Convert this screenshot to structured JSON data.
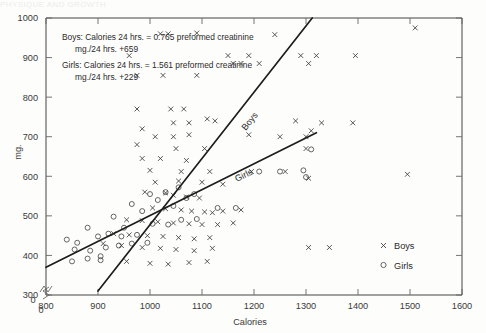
{
  "page_artifact": "PHYSIQUE AND GROWTH",
  "figure": {
    "y_axis_title": "mg.",
    "x_axis_title": "Calories",
    "origin_label": "0",
    "y_ticks": [
      300,
      400,
      500,
      600,
      700,
      800,
      900,
      1000
    ],
    "x_ticks": [
      800,
      900,
      1000,
      1100,
      1200,
      1300,
      1400,
      1500,
      1600
    ],
    "annotation": {
      "boys_line1": "Boys: Calories 24 hrs.  =  0.765 preformed creatinine",
      "boys_line2": "mg./24 hrs.  +659",
      "girls_line1": "Girls: Calories 24 hrs.  =  1.561 preformed creatinine",
      "girls_line2": "mg./24 hrs.  +229"
    },
    "curve_labels": {
      "boys": "Boys",
      "girls": "Girls"
    },
    "legend": [
      {
        "marker": "x-marker",
        "label": "Boys"
      },
      {
        "marker": "circle-marker",
        "label": "Girls"
      }
    ]
  },
  "chart_data": {
    "type": "scatter",
    "title": "",
    "xlabel": "Calories",
    "ylabel": "mg.",
    "xlim": [
      800,
      1600
    ],
    "ylim": [
      300,
      1000
    ],
    "xticks": [
      800,
      900,
      1000,
      1100,
      1200,
      1300,
      1400,
      1500,
      1600
    ],
    "yticks": [
      300,
      400,
      500,
      600,
      700,
      800,
      900,
      1000
    ],
    "grid": false,
    "axis_break": {
      "x": true,
      "y": true,
      "origin_label": "0"
    },
    "legend_position": "lower-right",
    "series": [
      {
        "name": "Boys",
        "marker": "x",
        "color": "#3b3b3b",
        "points": [
          [
            960,
            905
          ],
          [
            1020,
            960
          ],
          [
            1035,
            960
          ],
          [
            1090,
            962
          ],
          [
            1240,
            958
          ],
          [
            975,
            855
          ],
          [
            1025,
            855
          ],
          [
            1090,
            855
          ],
          [
            1150,
            905
          ],
          [
            1190,
            905
          ],
          [
            1290,
            905
          ],
          [
            1320,
            905
          ],
          [
            1395,
            905
          ],
          [
            1510,
            975
          ],
          [
            975,
            770
          ],
          [
            1040,
            770
          ],
          [
            1065,
            770
          ],
          [
            1160,
            885
          ],
          [
            1175,
            885
          ],
          [
            1210,
            885
          ],
          [
            1305,
            885
          ],
          [
            985,
            720
          ],
          [
            1045,
            735
          ],
          [
            1075,
            735
          ],
          [
            1110,
            745
          ],
          [
            1125,
            740
          ],
          [
            1280,
            740
          ],
          [
            1330,
            735
          ],
          [
            1390,
            735
          ],
          [
            1010,
            700
          ],
          [
            1045,
            700
          ],
          [
            1075,
            705
          ],
          [
            1190,
            705
          ],
          [
            1250,
            700
          ],
          [
            1300,
            700
          ],
          [
            1310,
            715
          ],
          [
            975,
            680
          ],
          [
            1050,
            670
          ],
          [
            1105,
            670
          ],
          [
            1300,
            670
          ],
          [
            985,
            645
          ],
          [
            1020,
            645
          ],
          [
            1070,
            640
          ],
          [
            1000,
            615
          ],
          [
            1060,
            612
          ],
          [
            1115,
            612
          ],
          [
            1195,
            612
          ],
          [
            1260,
            612
          ],
          [
            1010,
            585
          ],
          [
            1055,
            588
          ],
          [
            1100,
            585
          ],
          [
            1140,
            580
          ],
          [
            1305,
            595
          ],
          [
            990,
            560
          ],
          [
            1030,
            558
          ],
          [
            1045,
            552
          ],
          [
            1070,
            548
          ],
          [
            1095,
            545
          ],
          [
            1005,
            520
          ],
          [
            1030,
            518
          ],
          [
            1060,
            515
          ],
          [
            1080,
            512
          ],
          [
            1105,
            510
          ],
          [
            1120,
            508
          ],
          [
            1140,
            512
          ],
          [
            1175,
            515
          ],
          [
            955,
            490
          ],
          [
            985,
            488
          ],
          [
            1015,
            485
          ],
          [
            1045,
            482
          ],
          [
            1075,
            480
          ],
          [
            1100,
            478
          ],
          [
            1130,
            478
          ],
          [
            1160,
            482
          ],
          [
            930,
            455
          ],
          [
            960,
            452
          ],
          [
            995,
            450
          ],
          [
            1025,
            448
          ],
          [
            1055,
            445
          ],
          [
            1085,
            442
          ],
          [
            1115,
            445
          ],
          [
            910,
            430
          ],
          [
            945,
            425
          ],
          [
            985,
            420
          ],
          [
            1020,
            418
          ],
          [
            1050,
            415
          ],
          [
            1085,
            412
          ],
          [
            1120,
            418
          ],
          [
            955,
            385
          ],
          [
            1000,
            380
          ],
          [
            1035,
            378
          ],
          [
            1075,
            382
          ],
          [
            1110,
            385
          ],
          [
            1305,
            420
          ],
          [
            1345,
            420
          ],
          [
            1495,
            605
          ]
        ]
      },
      {
        "name": "Girls",
        "marker": "o",
        "color": "#4a4a4a",
        "points": [
          [
            840,
            440
          ],
          [
            860,
            432
          ],
          [
            880,
            470
          ],
          [
            905,
            398
          ],
          [
            930,
            498
          ],
          [
            950,
            470
          ],
          [
            965,
            530
          ],
          [
            985,
            512
          ],
          [
            1000,
            555
          ],
          [
            1015,
            540
          ],
          [
            1030,
            560
          ],
          [
            1045,
            525
          ],
          [
            1055,
            572
          ],
          [
            1070,
            545
          ],
          [
            1085,
            555
          ],
          [
            900,
            448
          ],
          [
            920,
            455
          ],
          [
            945,
            448
          ],
          [
            975,
            452
          ],
          [
            1005,
            480
          ],
          [
            1035,
            478
          ],
          [
            1060,
            490
          ],
          [
            1090,
            492
          ],
          [
            855,
            415
          ],
          [
            885,
            412
          ],
          [
            915,
            420
          ],
          [
            940,
            425
          ],
          [
            965,
            430
          ],
          [
            995,
            432
          ],
          [
            850,
            385
          ],
          [
            880,
            392
          ],
          [
            905,
            388
          ],
          [
            1130,
            520
          ],
          [
            1165,
            520
          ],
          [
            1210,
            612
          ],
          [
            1250,
            612
          ],
          [
            1300,
            598
          ],
          [
            1310,
            668
          ],
          [
            1295,
            615
          ]
        ]
      }
    ],
    "fit_lines": [
      {
        "name": "Boys",
        "label": "Boys",
        "equation": "Calories 24 hrs. = 0.765 preformed creatinine mg./24 hrs. + 659",
        "slope": 0.765,
        "intercept": 659,
        "x_start": 900,
        "y_start": 310,
        "x_end": 1312,
        "y_end": 1000
      },
      {
        "name": "Girls",
        "label": "Girls",
        "equation": "Calories 24 hrs. = 1.561 preformed creatinine mg./24 hrs. + 229",
        "slope": 1.561,
        "intercept": 229,
        "x_start": 800,
        "y_start": 370,
        "x_end": 1320,
        "y_end": 710
      }
    ],
    "intersection": [
      1085,
      540
    ]
  }
}
